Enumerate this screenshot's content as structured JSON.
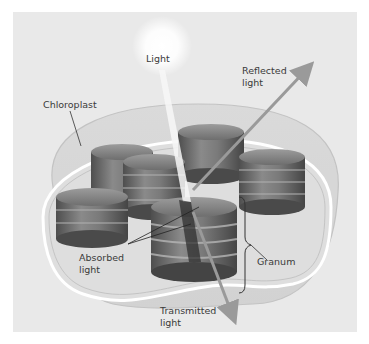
{
  "diagram": {
    "labels": {
      "light": "Light",
      "reflected_line1": "Reflected",
      "reflected_line2": "light",
      "chloroplast": "Chloroplast",
      "absorbed_line1": "Absorbed",
      "absorbed_line2": "light",
      "granum": "Granum",
      "transmitted_line1": "Transmitted",
      "transmitted_line2": "light"
    },
    "colors": {
      "background": "#e9e9e9",
      "border": "#ffffff",
      "granum": "#6f6f6f",
      "arrow": "#9a9a9a",
      "light_glow": "#ffffff"
    }
  }
}
